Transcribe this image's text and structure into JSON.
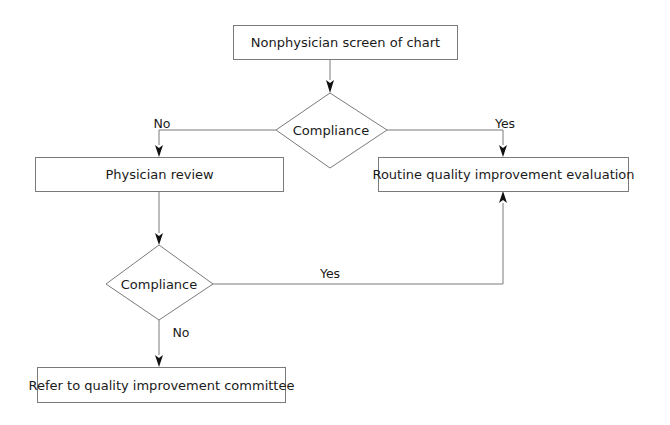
{
  "diagram": {
    "type": "flowchart",
    "colors": {
      "line": "#7a7a7a",
      "arrow": "#111111",
      "text": "#1a1a1a",
      "background": "#ffffff"
    },
    "nodes": {
      "start": {
        "shape": "rectangle",
        "label": "Nonphysician screen of chart"
      },
      "decision1": {
        "shape": "diamond",
        "label": "Compliance"
      },
      "physician_review": {
        "shape": "rectangle",
        "label": "Physician review"
      },
      "routine_qi": {
        "shape": "rectangle",
        "label": "Routine quality improvement evaluation"
      },
      "decision2": {
        "shape": "diamond",
        "label": "Compliance"
      },
      "refer_committee": {
        "shape": "rectangle",
        "label": "Refer to quality improvement committee"
      }
    },
    "edges": {
      "start_to_decision1": {
        "from": "start",
        "to": "decision1",
        "label": ""
      },
      "decision1_no": {
        "from": "decision1",
        "to": "physician_review",
        "label": "No"
      },
      "decision1_yes": {
        "from": "decision1",
        "to": "routine_qi",
        "label": "Yes"
      },
      "review_to_decision2": {
        "from": "physician_review",
        "to": "decision2",
        "label": ""
      },
      "decision2_yes": {
        "from": "decision2",
        "to": "routine_qi",
        "label": "Yes"
      },
      "decision2_no": {
        "from": "decision2",
        "to": "refer_committee",
        "label": "No"
      }
    }
  }
}
